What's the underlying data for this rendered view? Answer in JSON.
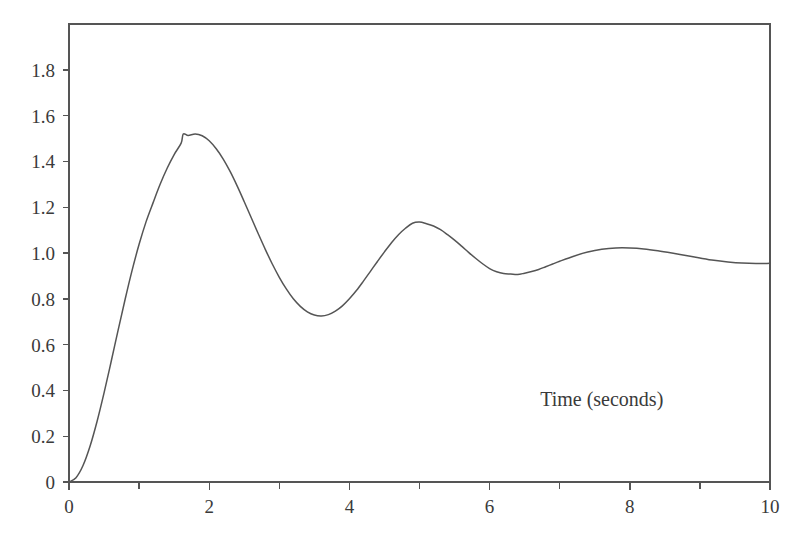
{
  "chart_data": {
    "type": "line",
    "title": "",
    "subtitle": "",
    "xlabel": "Time (seconds)",
    "ylabel": "",
    "xlim": [
      0,
      10
    ],
    "ylim": [
      0,
      2.0
    ],
    "grid": false,
    "legend": false,
    "legend_position": "none",
    "line_color": "#555555",
    "background_color": "#ffffff",
    "axis_color": "#555555",
    "xticks": [
      0,
      2,
      4,
      6,
      8,
      10
    ],
    "xtick_labels": [
      "0",
      "2",
      "4",
      "6",
      "8",
      "10"
    ],
    "x_minor_ticks": [
      1,
      3,
      5,
      7,
      9
    ],
    "yticks": [
      0,
      0.2,
      0.4,
      0.6,
      0.8,
      1.0,
      1.2,
      1.4,
      1.6,
      1.8
    ],
    "ytick_labels": [
      "0",
      "0.2",
      "0.4",
      "0.6",
      "0.8",
      "1.0",
      "1.2",
      "1.4",
      "1.6",
      "1.8"
    ],
    "annotations": [
      {
        "text": "Time (seconds)",
        "x": 7.6,
        "y": 0.33
      }
    ],
    "key_points": {
      "start": {
        "x": 0,
        "y": 0
      },
      "first_peak": {
        "x": 1.63,
        "y": 1.52
      },
      "first_trough": {
        "x": 3.3,
        "y": 0.716
      },
      "second_peak": {
        "x": 4.8,
        "y": 1.13
      },
      "second_trough": {
        "x": 6.4,
        "y": 0.91
      },
      "third_peak": {
        "x": 8.0,
        "y": 1.02
      },
      "end": {
        "x": 10,
        "y": 0.955
      },
      "steady_state": 0.96
    },
    "series": [
      {
        "name": "step response",
        "x": [
          0,
          0.1,
          0.2,
          0.3,
          0.4,
          0.5,
          0.6,
          0.7,
          0.8,
          0.9,
          1.0,
          1.1,
          1.2,
          1.3,
          1.4,
          1.5,
          1.6,
          1.63,
          1.7,
          1.8,
          1.9,
          2.0,
          2.1,
          2.2,
          2.3,
          2.4,
          2.5,
          2.6,
          2.7,
          2.8,
          2.9,
          3.0,
          3.1,
          3.2,
          3.3,
          3.4,
          3.5,
          3.6,
          3.7,
          3.8,
          3.9,
          4.0,
          4.1,
          4.2,
          4.3,
          4.4,
          4.5,
          4.6,
          4.7,
          4.8,
          4.9,
          5.0,
          5.1,
          5.2,
          5.3,
          5.4,
          5.5,
          5.6,
          5.7,
          5.8,
          5.9,
          6.0,
          6.1,
          6.2,
          6.3,
          6.4,
          6.5,
          6.6,
          6.7,
          6.8,
          6.9,
          7.0,
          7.2,
          7.4,
          7.6,
          7.8,
          8.0,
          8.2,
          8.4,
          8.6,
          8.8,
          9.0,
          9.2,
          9.4,
          9.6,
          9.8,
          10.0
        ],
        "y": [
          0,
          0.019,
          0.072,
          0.156,
          0.264,
          0.389,
          0.524,
          0.662,
          0.797,
          0.924,
          1.038,
          1.137,
          1.22,
          1.3,
          1.37,
          1.43,
          1.48,
          1.52,
          1.513,
          1.52,
          1.512,
          1.49,
          1.455,
          1.41,
          1.355,
          1.292,
          1.224,
          1.154,
          1.084,
          1.016,
          0.952,
          0.894,
          0.843,
          0.8,
          0.767,
          0.743,
          0.729,
          0.725,
          0.731,
          0.746,
          0.769,
          0.8,
          0.836,
          0.877,
          0.92,
          0.963,
          1.005,
          1.045,
          1.08,
          1.108,
          1.13,
          1.135,
          1.128,
          1.118,
          1.102,
          1.08,
          1.056,
          1.03,
          1.003,
          0.977,
          0.953,
          0.932,
          0.918,
          0.91,
          0.908,
          0.906,
          0.912,
          0.919,
          0.928,
          0.94,
          0.952,
          0.964,
          0.986,
          1.004,
          1.016,
          1.022,
          1.022,
          1.018,
          1.01,
          1.0,
          0.989,
          0.978,
          0.968,
          0.961,
          0.956,
          0.954,
          0.955
        ]
      }
    ]
  },
  "plot_geometry": {
    "left": 69,
    "right": 770,
    "top": 24,
    "bottom": 482
  }
}
